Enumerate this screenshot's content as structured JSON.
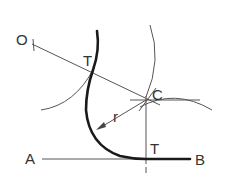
{
  "diagram": {
    "type": "geometric-construction",
    "labels": {
      "point_o": "O",
      "tangent_upper": "T",
      "center": "C",
      "radius": "r",
      "point_a": "A",
      "tangent_lower": "T",
      "point_b": "B"
    },
    "colors": {
      "line": "#555555",
      "thick_line": "#1a1a1a",
      "text": "#333333",
      "background": "#ffffff"
    }
  }
}
